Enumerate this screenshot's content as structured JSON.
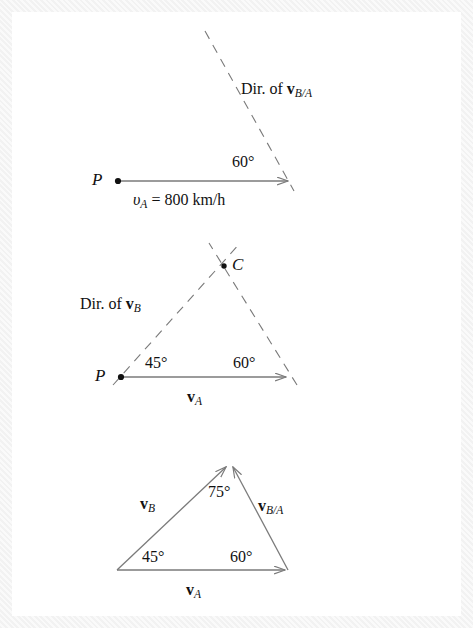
{
  "figure": {
    "background_color": "#f4f4f4",
    "panel_color": "#ffffff",
    "line_color": "#7a7a7a",
    "text_color": "#111111"
  },
  "diagram1": {
    "name": "velocity-of-A-with-direction-of-vBA",
    "point_label": "P",
    "angle_label": "60°",
    "speed_label_v": "υ",
    "speed_label_sub": "A",
    "speed_label_rest": " = 800 km/h",
    "dir_prefix": "Dir. of ",
    "dir_vector": "v",
    "dir_vector_sub": "B/A",
    "arrow": {
      "x1": 119,
      "y1": 181,
      "x2": 291,
      "y2": 181
    },
    "dashed": {
      "x1": 205,
      "y1": 31,
      "x2": 294,
      "y2": 191
    },
    "angle_value_deg": 60
  },
  "diagram2": {
    "name": "construction-triangle-with-point-C",
    "point_label_p": "P",
    "point_label_c": "C",
    "angle_left": "45°",
    "angle_right": "60°",
    "dir_prefix": "Dir. of ",
    "dir_vector": "v",
    "dir_vector_sub": "B",
    "base_vector": "v",
    "base_vector_sub": "A",
    "arrow": {
      "x1": 122,
      "y1": 377,
      "x2": 289,
      "y2": 377
    },
    "dashed_left": {
      "x1": 113,
      "y1": 385,
      "x2": 241,
      "y2": 242
    },
    "dashed_right": {
      "x1": 296,
      "y1": 384,
      "x2": 209,
      "y2": 243
    },
    "point_c": {
      "cx": 224,
      "cy": 266
    },
    "angle_left_deg": 45,
    "angle_right_deg": 60
  },
  "diagram3": {
    "name": "closed-velocity-triangle",
    "angle_left": "45°",
    "angle_apex": "75°",
    "angle_right": "60°",
    "vector_b": "v",
    "vector_b_sub": "B",
    "vector_ba": "v",
    "vector_ba_sub": "B/A",
    "vector_a": "v",
    "vector_a_sub": "A",
    "vertices": {
      "bottom_left": {
        "x": 117,
        "y": 570
      },
      "bottom_right": {
        "x": 288,
        "y": 570
      },
      "apex": {
        "x": 229,
        "y": 463
      }
    },
    "angle_left_deg": 45,
    "angle_apex_deg": 75,
    "angle_right_deg": 60
  }
}
